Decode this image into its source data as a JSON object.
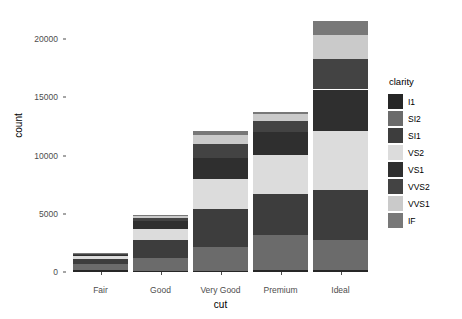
{
  "chart_data": {
    "type": "bar",
    "stacked": true,
    "title": "",
    "xlabel": "cut",
    "ylabel": "count",
    "categories": [
      "Fair",
      "Good",
      "Very Good",
      "Premium",
      "Ideal"
    ],
    "legend_title": "clarity",
    "legend_position": "right",
    "grid": false,
    "ylim": [
      0,
      22000
    ],
    "yticks": [
      0,
      5000,
      10000,
      15000,
      20000
    ],
    "ytick_labels": [
      "0",
      "5000",
      "10000",
      "15000",
      "20000"
    ],
    "series": [
      {
        "name": "I1",
        "color": "#262626",
        "values": [
          210,
          96,
          84,
          205,
          146
        ]
      },
      {
        "name": "SI2",
        "color": "#6b6b6b",
        "values": [
          466,
          1081,
          2100,
          2949,
          2598
        ]
      },
      {
        "name": "SI1",
        "color": "#3d3d3d",
        "values": [
          408,
          1560,
          3240,
          3575,
          4282
        ]
      },
      {
        "name": "VS2",
        "color": "#dcdcdc",
        "values": [
          261,
          978,
          2591,
          3357,
          5071
        ]
      },
      {
        "name": "VS1",
        "color": "#2f2f2f",
        "values": [
          170,
          648,
          1775,
          1989,
          3589
        ]
      },
      {
        "name": "VVS2",
        "color": "#434343",
        "values": [
          69,
          286,
          1235,
          870,
          2606
        ]
      },
      {
        "name": "VVS1",
        "color": "#cacaca",
        "values": [
          17,
          186,
          789,
          616,
          2047
        ]
      },
      {
        "name": "IF",
        "color": "#787878",
        "values": [
          9,
          71,
          268,
          230,
          1212
        ]
      }
    ],
    "totals": [
      1610,
      4906,
      12082,
      13791,
      21551
    ]
  },
  "axis": {
    "y_title": "count",
    "x_title": "cut"
  }
}
